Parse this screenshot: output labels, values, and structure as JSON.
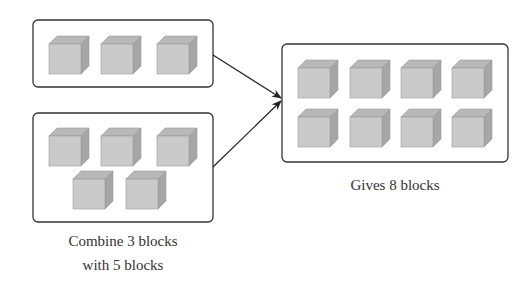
{
  "groups": {
    "left_top": {
      "count": 3
    },
    "left_bottom": {
      "count": 5
    },
    "result": {
      "count": 8
    }
  },
  "labels": {
    "combine_line1": "Combine 3 blocks",
    "combine_line2": "with 5 blocks",
    "result": "Gives 8 blocks"
  },
  "colors": {
    "cube_front": "#c8c8c8",
    "cube_top": "#b4b4b4",
    "cube_side": "#a4a4a4",
    "stroke": "#333333"
  }
}
